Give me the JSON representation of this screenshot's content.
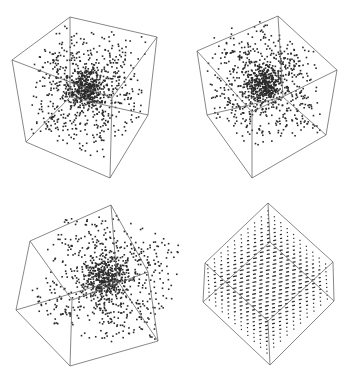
{
  "chart_data": [
    {
      "type": "scatter",
      "title": "",
      "panel": "top-left",
      "description": "3D random point cloud inside cube wireframe",
      "distribution": "random-uniform-with-center-cluster",
      "point_count": 1000,
      "vertices": {
        "A": [
          70,
          17
        ],
        "B": [
          157,
          37
        ],
        "C": [
          148,
          115
        ],
        "D": [
          110,
          178
        ],
        "E": [
          26,
          142
        ],
        "F": [
          12,
          60
        ],
        "G": [
          70,
          97
        ],
        "H": [
          112,
          98
        ]
      },
      "edges": [
        [
          "A",
          "B"
        ],
        [
          "B",
          "C"
        ],
        [
          "C",
          "D"
        ],
        [
          "D",
          "E"
        ],
        [
          "E",
          "F"
        ],
        [
          "F",
          "A"
        ],
        [
          "A",
          "G"
        ],
        [
          "G",
          "E"
        ],
        [
          "G",
          "C"
        ],
        [
          "H",
          "B"
        ],
        [
          "H",
          "D"
        ],
        [
          "H",
          "F"
        ]
      ]
    },
    {
      "type": "scatter",
      "title": "",
      "panel": "top-right",
      "description": "3D random point cloud inside cube wireframe",
      "distribution": "random-uniform-with-center-cluster",
      "point_count": 1000,
      "vertices": {
        "A": [
          278,
          16
        ],
        "B": [
          337,
          70
        ],
        "C": [
          326,
          135
        ],
        "D": [
          252,
          178
        ],
        "E": [
          207,
          115
        ],
        "F": [
          197,
          51
        ],
        "G": [
          283,
          97
        ],
        "H": [
          252,
          112
        ]
      },
      "edges": [
        [
          "A",
          "B"
        ],
        [
          "B",
          "C"
        ],
        [
          "C",
          "D"
        ],
        [
          "D",
          "E"
        ],
        [
          "E",
          "F"
        ],
        [
          "F",
          "A"
        ],
        [
          "A",
          "G"
        ],
        [
          "G",
          "C"
        ],
        [
          "G",
          "E"
        ],
        [
          "H",
          "F"
        ],
        [
          "H",
          "D"
        ],
        [
          "H",
          "B"
        ]
      ]
    },
    {
      "type": "scatter",
      "title": "",
      "panel": "bottom-left",
      "description": "3D random point cloud inside cube wireframe",
      "distribution": "random-uniform-with-center-cluster",
      "point_count": 1000,
      "vertices": {
        "A": [
          111,
          205
        ],
        "B": [
          148,
          272
        ],
        "C": [
          158,
          341
        ],
        "D": [
          70,
          366
        ],
        "E": [
          16,
          310
        ],
        "F": [
          30,
          241
        ],
        "G": [
          72,
          300
        ],
        "H": [
          117,
          280
        ]
      },
      "edges": [
        [
          "A",
          "B"
        ],
        [
          "B",
          "C"
        ],
        [
          "C",
          "D"
        ],
        [
          "D",
          "E"
        ],
        [
          "E",
          "F"
        ],
        [
          "F",
          "A"
        ],
        [
          "G",
          "F"
        ],
        [
          "G",
          "B"
        ],
        [
          "G",
          "D"
        ],
        [
          "H",
          "A"
        ],
        [
          "H",
          "E"
        ],
        [
          "H",
          "C"
        ]
      ]
    },
    {
      "type": "scatter",
      "title": "",
      "panel": "bottom-right",
      "description": "3D lattice (grid) points inside cube wireframe, forming parallel line rows",
      "distribution": "lattice",
      "grid_size": 10,
      "vertices": {
        "A": [
          268,
          203
        ],
        "B": [
          333,
          262
        ],
        "C": [
          334,
          301
        ],
        "D": [
          270,
          365
        ],
        "E": [
          203,
          302
        ],
        "F": [
          205,
          263
        ],
        "G": [
          270,
          242
        ],
        "H": [
          268,
          321
        ]
      },
      "edges": [
        [
          "A",
          "B"
        ],
        [
          "B",
          "C"
        ],
        [
          "C",
          "D"
        ],
        [
          "D",
          "E"
        ],
        [
          "E",
          "F"
        ],
        [
          "F",
          "A"
        ],
        [
          "A",
          "G"
        ],
        [
          "G",
          "E"
        ],
        [
          "G",
          "C"
        ],
        [
          "H",
          "F"
        ],
        [
          "H",
          "B"
        ],
        [
          "H",
          "D"
        ]
      ]
    }
  ],
  "style": {
    "edge_color": "#6a6a6a",
    "point_color": "#2a2a2a",
    "background": "#ffffff"
  }
}
